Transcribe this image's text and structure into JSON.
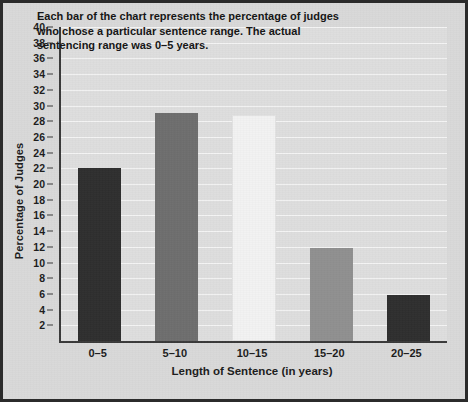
{
  "chart_data": {
    "type": "bar",
    "title": "",
    "categories": [
      "0–5",
      "5–10",
      "10–15",
      "15–20",
      "20–25"
    ],
    "values": [
      22,
      29,
      28.8,
      11.8,
      5.8
    ],
    "xlabel": "Length of Sentence (in years)",
    "ylabel": "Percentage of Judges",
    "ylim": [
      0,
      40
    ],
    "ytick_labels": [
      "2",
      "4",
      "6",
      "8",
      "10",
      "12",
      "14",
      "16",
      "18",
      "20",
      "22",
      "24",
      "26",
      "28",
      "30",
      "32",
      "34",
      "36",
      "38",
      "40"
    ],
    "ytick_values": [
      2,
      4,
      6,
      8,
      10,
      12,
      14,
      16,
      18,
      20,
      22,
      24,
      26,
      28,
      30,
      32,
      34,
      36,
      38,
      40
    ],
    "grid": true,
    "legend": "none",
    "annotation": "Each bar of the chart represents the percentage of judges who chose a particular sentence range. The actual sentencing range was 0–5 years.",
    "bar_colors": [
      "#2f2f2f",
      "#6e6e6e",
      "#f2f2f2",
      "#909090",
      "#2f2f2f"
    ]
  },
  "style": {
    "figure_background": "#d9d9d9",
    "plot_background": "#dedede",
    "gridline_color": "#f4f4f4",
    "axis_color": "#3a3a3a",
    "border_color": "#2b2b2b",
    "text_color": "#1c1c1c"
  }
}
